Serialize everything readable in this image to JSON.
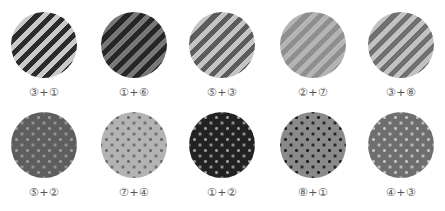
{
  "rows": [
    {
      "pattern": "stripes",
      "swatches": [
        {
          "label": "③+①",
          "color_a": "#2b2b2b",
          "color_b": "#c9c9c9"
        },
        {
          "label": "①+⑥",
          "color_a": "#262626",
          "color_b": "#777777"
        },
        {
          "label": "⑤+③",
          "color_a": "#5c5c5c",
          "color_b": "#c4c4c4"
        },
        {
          "label": "②+⑦",
          "color_a": "#8f8f8f",
          "color_b": "#b4b4b4"
        },
        {
          "label": "③+⑧",
          "color_a": "#707070",
          "color_b": "#c2c2c2"
        }
      ]
    },
    {
      "pattern": "dots",
      "swatches": [
        {
          "label": "⑤+②",
          "bg": "#5e5e5e",
          "dot": "#9a9a9a"
        },
        {
          "label": "⑦+④",
          "bg": "#b3b3b3",
          "dot": "#6a6a6a"
        },
        {
          "label": "①+②",
          "bg": "#222222",
          "dot": "#9a9a9a"
        },
        {
          "label": "⑧+①",
          "bg": "#8a8a8a",
          "dot": "#1e1e1e"
        },
        {
          "label": "④+③",
          "bg": "#6e6e6e",
          "dot": "#c2c2c2"
        }
      ]
    }
  ]
}
